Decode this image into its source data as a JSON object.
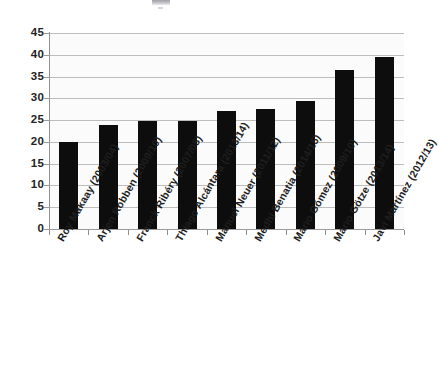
{
  "chart_data": {
    "type": "bar",
    "title": "",
    "xlabel": "",
    "ylabel": "",
    "ylim": [
      0,
      45
    ],
    "yticks": [
      0,
      5,
      10,
      15,
      20,
      25,
      30,
      35,
      40,
      45
    ],
    "grid": true,
    "legend": null,
    "bar_color": "#0d0d0d",
    "categories": [
      "Roy Makaay (2003/04)",
      "Arjen Robben (2009/10)",
      "Franck Ribéry (2007/08)",
      "Thiago Alcántara (2013/14)",
      "Manuel Neuer (2011/12)",
      "Medhi Benatia (2014/15)",
      "Mario Gómez (2009/10)",
      "Mario Götze (2013/14)",
      "Javi Martínez (2012/13)"
    ],
    "values": [
      20,
      23.9,
      24.8,
      24.8,
      27.2,
      27.5,
      29.5,
      36.4,
      39.4
    ]
  },
  "style": {
    "plot_background": "#fbfbfb",
    "gridline_color": "#bdbdbd",
    "axis_color": "#8f8f8f",
    "tick_label_color": "#232323"
  }
}
